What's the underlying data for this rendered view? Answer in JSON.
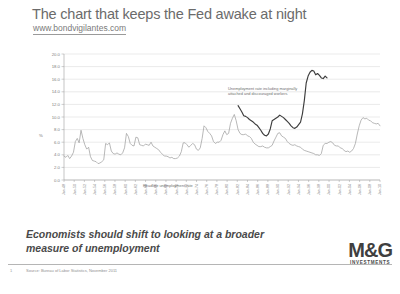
{
  "header": {
    "title": "The chart that keeps the Fed awake at night",
    "subtitle": "www.bondvigilantes.com"
  },
  "caption": "Economists should shift to looking at a broader measure of unemployment",
  "footer": {
    "page_number": "1",
    "source": "Source: Bureau of Labor Statistics, November 2011"
  },
  "logo": {
    "mark": "M&G",
    "sub": "INVESTMENTS"
  },
  "chart_data": {
    "type": "line",
    "title": "",
    "xlabel": "",
    "ylabel": "%",
    "ylim": [
      0,
      20
    ],
    "ytick_step": 2,
    "grid": true,
    "legend_position": "inline-annotations",
    "ytick_labels": [
      "0.0",
      "2.0",
      "4.0",
      "6.0",
      "8.0",
      "10.0",
      "12.0",
      "14.0",
      "16.0",
      "18.0",
      "20.0"
    ],
    "xtick_labels": [
      "Jan-48",
      "Jan-50",
      "Jan-52",
      "Jan-54",
      "Jan-56",
      "Jan-58",
      "Jan-60",
      "Jan-62",
      "Jan-64",
      "Jan-66",
      "Jan-68",
      "Jan-70",
      "Jan-72",
      "Jan-74",
      "Jan-76",
      "Jan-78",
      "Jan-80",
      "Jan-82",
      "Jan-84",
      "Jan-86",
      "Jan-88",
      "Jan-90",
      "Jan-92",
      "Jan-94",
      "Jan-96",
      "Jan-98",
      "Jan-00",
      "Jan-02",
      "Jan-04",
      "Jan-06",
      "Jan-08",
      "Jan-10"
    ],
    "annotations": [
      "Unemployment rate including marginally attached and discouraged workers",
      "Headline unemployment rate"
    ],
    "series": [
      {
        "name": "Headline unemployment rate",
        "color": "#a0a0a0",
        "x_start": 1948.0,
        "x_step": 0.5,
        "values": [
          3.8,
          3.6,
          3.9,
          3.4,
          3.8,
          4.4,
          6.1,
          6.6,
          5.9,
          7.9,
          6.6,
          5.6,
          4.9,
          5.2,
          3.7,
          3.1,
          3.0,
          2.9,
          2.6,
          2.7,
          2.9,
          3.2,
          5.8,
          5.6,
          5.9,
          4.6,
          4.2,
          4.1,
          4.3,
          4.1,
          4.0,
          4.3,
          5.1,
          7.4,
          6.9,
          5.8,
          5.5,
          5.4,
          6.8,
          6.7,
          5.6,
          5.5,
          5.4,
          5.7,
          5.6,
          5.5,
          6.0,
          5.4,
          5.2,
          5.0,
          4.8,
          4.4,
          4.1,
          3.8,
          3.8,
          3.7,
          3.5,
          3.6,
          3.4,
          3.4,
          3.5,
          3.8,
          4.5,
          5.9,
          5.9,
          5.6,
          5.2,
          5.5,
          5.8,
          5.6,
          4.9,
          4.7,
          5.1,
          6.6,
          8.6,
          8.3,
          7.7,
          7.4,
          7.0,
          6.1,
          5.8,
          6.0,
          6.0,
          6.3,
          7.2,
          7.8,
          7.2,
          7.4,
          9.0,
          9.8,
          10.4,
          9.4,
          8.0,
          7.4,
          7.2,
          7.2,
          7.3,
          7.0,
          6.9,
          6.6,
          6.0,
          5.7,
          5.5,
          5.3,
          5.3,
          5.4,
          5.2,
          5.1,
          5.1,
          5.3,
          5.5,
          6.2,
          6.8,
          7.4,
          7.5,
          7.0,
          6.8,
          6.6,
          6.1,
          5.8,
          5.6,
          5.5,
          5.6,
          5.4,
          5.3,
          5.2,
          4.9,
          4.7,
          4.6,
          4.5,
          4.4,
          4.3,
          4.2,
          4.0,
          4.0,
          3.9,
          4.2,
          5.5,
          5.8,
          5.8,
          6.0,
          6.1,
          5.9,
          5.5,
          5.4,
          5.4,
          5.1,
          5.0,
          4.7,
          4.5,
          4.6,
          4.4,
          4.6,
          5.0,
          5.8,
          7.3,
          8.6,
          9.5,
          9.9,
          9.7,
          9.8,
          9.5,
          9.4,
          9.1,
          9.0,
          8.9,
          9.0,
          8.6
        ]
      },
      {
        "name": "Unemployment rate including marginally attached and discouraged workers",
        "color": "#3d3d3d",
        "x_start": 1994.0,
        "x_step": 0.5,
        "values": [
          11.8,
          11.3,
          10.8,
          10.2,
          10.1,
          9.9,
          9.6,
          9.4,
          9.2,
          8.9,
          8.7,
          8.3,
          7.9,
          7.4,
          7.1,
          7.0,
          7.3,
          8.1,
          9.4,
          9.6,
          9.8,
          10.0,
          10.3,
          10.1,
          9.9,
          9.6,
          9.3,
          9.0,
          8.6,
          8.3,
          8.2,
          8.4,
          8.8,
          9.2,
          10.5,
          12.6,
          15.4,
          16.5,
          17.1,
          17.4,
          17.3,
          16.7,
          16.9,
          16.6,
          16.2,
          16.1,
          16.5,
          16.2
        ]
      }
    ]
  }
}
